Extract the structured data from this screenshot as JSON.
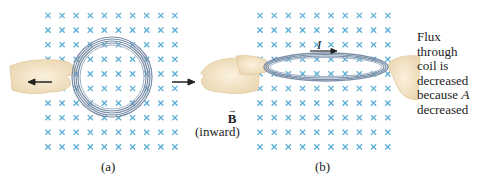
{
  "panels": [
    {
      "id": "a",
      "caption": "(a)"
    },
    {
      "id": "b",
      "caption": "(b)",
      "current_label": "I"
    }
  ],
  "field": {
    "symbol": "B",
    "direction": "(inward)",
    "marker": "×",
    "grid": {
      "rows": 10,
      "cols": 10
    }
  },
  "annotation": {
    "lines": [
      "Flux",
      "through",
      "coil is",
      "decreased",
      "because A",
      "decreased"
    ]
  },
  "colors": {
    "field_marker": "#5aaed6",
    "coil": "#7a8ea8",
    "hand": "#f3e4c6",
    "arrow": "#222222"
  }
}
